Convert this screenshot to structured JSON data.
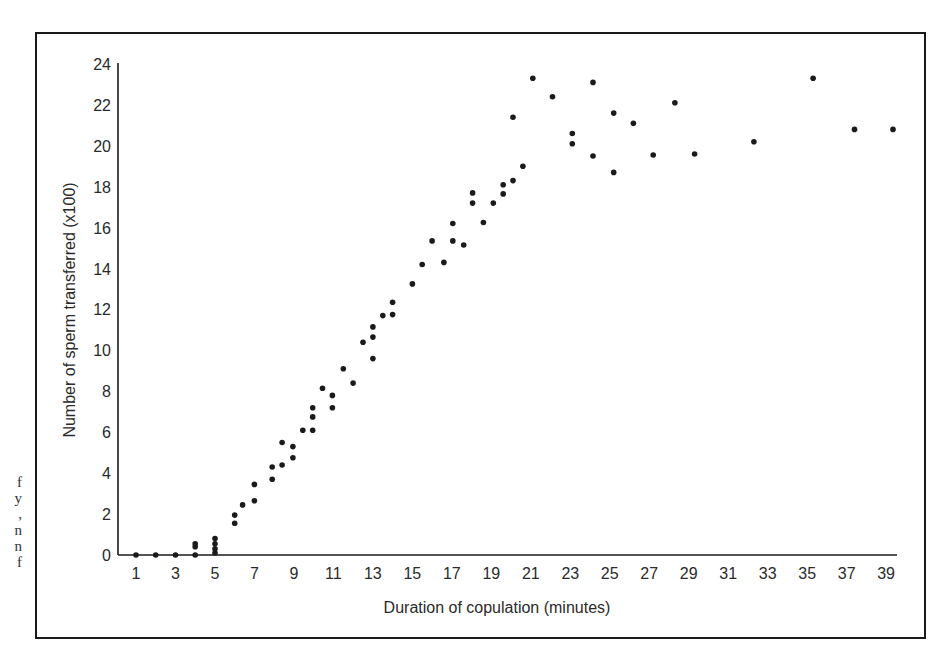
{
  "caption_fragments": [
    "f",
    "y",
    ",",
    "n",
    "n",
    "f"
  ],
  "chart_data": {
    "type": "scatter",
    "title": "",
    "xlabel": "Duration of copulation (minutes)",
    "ylabel": "Number of sperm transferred (x100)",
    "xlim": [
      0,
      40
    ],
    "ylim": [
      0,
      24
    ],
    "x_ticks": [
      1,
      3,
      5,
      7,
      9,
      11,
      13,
      15,
      17,
      19,
      21,
      23,
      25,
      27,
      29,
      31,
      33,
      35,
      37,
      39
    ],
    "y_ticks": [
      0,
      2,
      4,
      6,
      8,
      10,
      12,
      14,
      16,
      18,
      20,
      22,
      24
    ],
    "grid": false,
    "legend": null,
    "series": [
      {
        "name": "observations",
        "color": "#1a1a1a",
        "points": [
          [
            1,
            0
          ],
          [
            2,
            0
          ],
          [
            3,
            0
          ],
          [
            4,
            0
          ],
          [
            4,
            0.4
          ],
          [
            4,
            0.55
          ],
          [
            5,
            0.1
          ],
          [
            5,
            0.3
          ],
          [
            5,
            0.55
          ],
          [
            5,
            0.8
          ],
          [
            6,
            1.55
          ],
          [
            6,
            1.95
          ],
          [
            6.4,
            2.45
          ],
          [
            7,
            2.65
          ],
          [
            7,
            3.45
          ],
          [
            7.9,
            3.7
          ],
          [
            7.9,
            4.3
          ],
          [
            8.4,
            4.4
          ],
          [
            8.4,
            5.5
          ],
          [
            8.95,
            4.75
          ],
          [
            8.95,
            5.3
          ],
          [
            9.45,
            6.1
          ],
          [
            9.95,
            6.1
          ],
          [
            9.95,
            6.75
          ],
          [
            9.95,
            7.2
          ],
          [
            10.45,
            8.15
          ],
          [
            10.95,
            7.8
          ],
          [
            10.95,
            7.2
          ],
          [
            11.5,
            9.1
          ],
          [
            12,
            8.4
          ],
          [
            12.5,
            10.4
          ],
          [
            13,
            9.6
          ],
          [
            13,
            10.65
          ],
          [
            13,
            11.15
          ],
          [
            13.5,
            11.7
          ],
          [
            14,
            11.75
          ],
          [
            14,
            12.35
          ],
          [
            15,
            13.25
          ],
          [
            15.5,
            14.2
          ],
          [
            16,
            15.35
          ],
          [
            16.6,
            14.3
          ],
          [
            17.05,
            15.35
          ],
          [
            17.05,
            16.2
          ],
          [
            17.6,
            15.15
          ],
          [
            18.05,
            17.2
          ],
          [
            18.05,
            17.7
          ],
          [
            18.6,
            16.25
          ],
          [
            19.1,
            17.2
          ],
          [
            19.6,
            17.65
          ],
          [
            19.6,
            18.1
          ],
          [
            20.1,
            18.3
          ],
          [
            20.1,
            21.4
          ],
          [
            20.6,
            19.0
          ],
          [
            21.1,
            23.3
          ],
          [
            22.1,
            22.4
          ],
          [
            23.1,
            20.6
          ],
          [
            23.1,
            20.1
          ],
          [
            24.15,
            23.1
          ],
          [
            24.15,
            19.5
          ],
          [
            25.2,
            21.6
          ],
          [
            25.2,
            18.7
          ],
          [
            26.2,
            21.1
          ],
          [
            27.2,
            19.55
          ],
          [
            28.3,
            22.1
          ],
          [
            29.3,
            19.6
          ],
          [
            32.3,
            20.2
          ],
          [
            35.3,
            23.3
          ],
          [
            37.4,
            20.8
          ],
          [
            39.35,
            20.8
          ]
        ]
      }
    ]
  }
}
